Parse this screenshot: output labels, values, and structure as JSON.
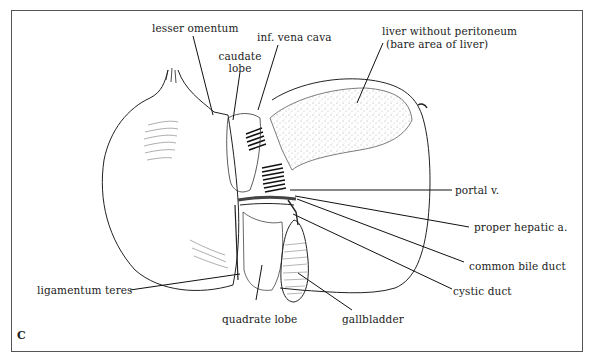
{
  "figure": {
    "panel_letter": "C",
    "labels": {
      "lesser_omentum": "lesser omentum",
      "caudate_lobe_line1": "caudate",
      "caudate_lobe_line2": "lobe",
      "inf_vena_cava": "inf. vena cava",
      "bare_area_line1": "liver without peritoneum",
      "bare_area_line2": "(bare area of liver)",
      "portal_vein": "portal v.",
      "proper_hepatic_artery": "proper hepatic a.",
      "common_bile_duct": "common bile duct",
      "cystic_duct": "cystic duct",
      "ligamentum_teres": "ligamentum teres",
      "quadrate_lobe": "quadrate lobe",
      "gallbladder": "gallbladder"
    }
  }
}
